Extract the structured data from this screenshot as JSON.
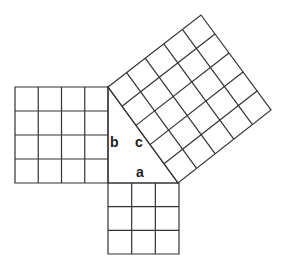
{
  "diagram": {
    "type": "pythagorean-theorem",
    "stroke_color": "#333333",
    "background": "#ffffff",
    "triangle": {
      "vertices": {
        "top": [
          108,
          87
        ],
        "right_angle": [
          108,
          183
        ],
        "right": [
          178,
          183
        ]
      },
      "labels": {
        "a": {
          "text": "a",
          "x": 136,
          "y": 177
        },
        "b": {
          "text": "b",
          "x": 110,
          "y": 147
        },
        "c": {
          "text": "c",
          "x": 135,
          "y": 147
        }
      }
    },
    "squares": [
      {
        "name": "square-b",
        "side_label": "b",
        "units": 4,
        "corners": [
          [
            15,
            87
          ],
          [
            108,
            87
          ],
          [
            108,
            183
          ],
          [
            15,
            183
          ]
        ]
      },
      {
        "name": "square-a",
        "side_label": "a",
        "units": 3,
        "corners": [
          [
            108,
            183
          ],
          [
            179,
            183
          ],
          [
            179,
            254
          ],
          [
            108,
            254
          ]
        ]
      },
      {
        "name": "square-c",
        "side_label": "c",
        "units": 5,
        "corners": [
          [
            108,
            87
          ],
          [
            201,
            15
          ],
          [
            271,
            110
          ],
          [
            178,
            183
          ]
        ]
      }
    ]
  }
}
